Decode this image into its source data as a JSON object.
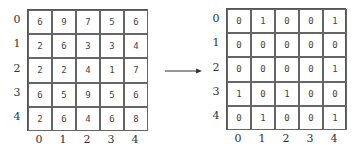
{
  "left_grid": {
    "row_labels": [
      "0",
      "1",
      "2",
      "3",
      "4"
    ],
    "col_labels": [
      "0",
      "1",
      "2",
      "3",
      "4"
    ],
    "cells": [
      [
        "6",
        "9",
        "7",
        "5",
        "6"
      ],
      [
        "2",
        "6",
        "3",
        "3",
        "4"
      ],
      [
        "2",
        "2",
        "4",
        "1",
        "7"
      ],
      [
        "6",
        "5",
        "9",
        "5",
        "6"
      ],
      [
        "2",
        "6",
        "4",
        "6",
        "8"
      ]
    ]
  },
  "right_grid": {
    "row_labels": [
      "0",
      "1",
      "2",
      "3",
      "4"
    ],
    "col_labels": [
      "0",
      "1",
      "2",
      "3",
      "4"
    ],
    "cells": [
      [
        "0",
        "1",
        "0",
        "0",
        "1"
      ],
      [
        "0",
        "0",
        "0",
        "0",
        "0"
      ],
      [
        "0",
        "0",
        "0",
        "0",
        "1"
      ],
      [
        "1",
        "0",
        "1",
        "0",
        "0"
      ],
      [
        "0",
        "1",
        "0",
        "0",
        "1"
      ]
    ]
  },
  "arrow": {
    "direction": "right",
    "color": "#333333"
  }
}
